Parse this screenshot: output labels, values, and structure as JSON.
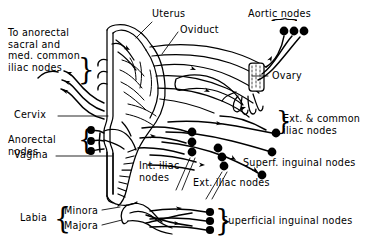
{
  "figure": {
    "kind": "anatomical-line-diagram",
    "background_color": "#ffffff",
    "ink_color": "#000000"
  },
  "labels": {
    "to_anorectal": "To anorectal\nsacral and\nmed. common\niliac nodes",
    "uterus": "Uterus",
    "oviduct": "Oviduct",
    "aortic_nodes": "Aortic nodes",
    "ovary": "Ovary",
    "cervix": "Cervix",
    "ext_common_iliac": "Ext. & common\niliac nodes",
    "anorectal_nodes": "Anorectal\nnodes",
    "vagina": "Vagina",
    "int_iliac_nodes": "Int. iliac\nnodes",
    "superf_inguinal_nodes": "Superf. inguinal nodes",
    "ext_iliac_nodes": "Ext. iliac nodes",
    "labia": "Labia",
    "minora": "Minora",
    "majora": "Majora",
    "superficial_inguinal_nodes": "Superficial inguinal nodes"
  },
  "braces": {
    "aortic": "⏞",
    "to_anorectal": "}",
    "ext_common_iliac": "}",
    "anorectal": "{",
    "labia": "{",
    "superficial_inguinal": "}"
  },
  "node_groups": [
    {
      "name": "aortic-nodes",
      "count": 3,
      "orientation": "horizontal"
    },
    {
      "name": "ext-common-iliac-nodes",
      "count": 3,
      "orientation": "diagonal"
    },
    {
      "name": "ext-iliac-nodes",
      "count": 3,
      "orientation": "vertical"
    },
    {
      "name": "int-iliac-nodes",
      "count": 3,
      "orientation": "vertical"
    },
    {
      "name": "superf-inguinal-node",
      "count": 1,
      "orientation": "single"
    },
    {
      "name": "anorectal-nodes",
      "count": 3,
      "orientation": "vertical"
    },
    {
      "name": "superficial-inguinal-nodes",
      "count": 3,
      "orientation": "vertical"
    }
  ],
  "organs": [
    "uterus-body",
    "uterine-cavity",
    "cervix",
    "vagina",
    "oviduct",
    "broad-ligament",
    "ovary",
    "fimbriae",
    "labia-minora",
    "labia-majora"
  ]
}
